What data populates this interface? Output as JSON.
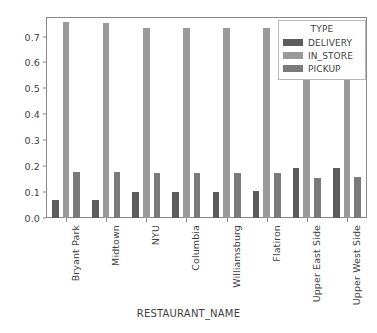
{
  "chart_data": {
    "type": "bar",
    "title": "",
    "xlabel": "RESTAURANT_NAME",
    "ylabel": "",
    "categories": [
      "Bryant Park",
      "Midtown",
      "NYU",
      "Columbia",
      "Williamsburg",
      "Flatiron",
      "Upper East Side",
      "Upper West Side"
    ],
    "series": [
      {
        "name": "DELIVERY",
        "color": "#5c5c5c",
        "values": [
          0.07,
          0.071,
          0.102,
          0.102,
          0.102,
          0.103,
          0.192,
          0.194
        ]
      },
      {
        "name": "IN_STORE",
        "color": "#9a9a9a",
        "values": [
          0.755,
          0.754,
          0.735,
          0.733,
          0.734,
          0.734,
          0.732,
          0.73
        ]
      },
      {
        "name": "PICKUP",
        "color": "#7a7a7a",
        "values": [
          0.178,
          0.179,
          0.172,
          0.173,
          0.173,
          0.174,
          0.156,
          0.157
        ]
      }
    ],
    "yticks": [
      0.0,
      0.1,
      0.2,
      0.3,
      0.4,
      0.5,
      0.6,
      0.7
    ],
    "ytick_labels": [
      "0.0",
      "0.1",
      "0.2",
      "0.3",
      "0.4",
      "0.5",
      "0.6",
      "0.7"
    ],
    "ylim": [
      0.0,
      0.7755
    ],
    "grid": false,
    "legend": {
      "title": "TYPE",
      "position": "upper right",
      "entries": [
        "DELIVERY",
        "IN_STORE",
        "PICKUP"
      ]
    }
  }
}
